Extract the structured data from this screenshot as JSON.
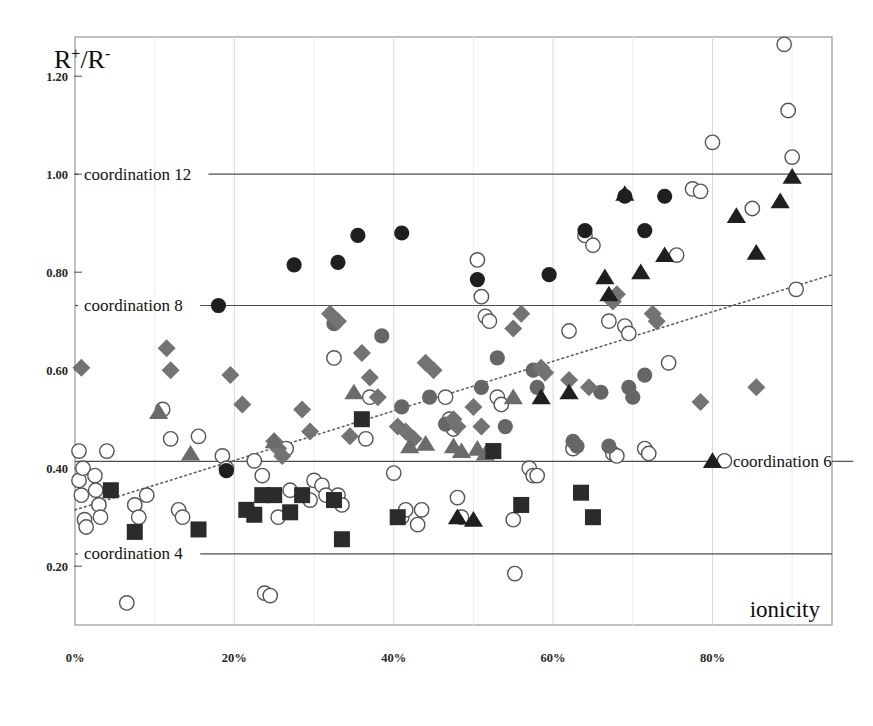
{
  "chart_data": {
    "type": "scatter",
    "title": "",
    "xlabel": "ionicity",
    "ylabel": "R+/R-",
    "ylabel_parts": {
      "base1": "R",
      "sup1": "+",
      "slash": "/",
      "base2": "R",
      "sup2": "-"
    },
    "xlim": [
      0,
      95
    ],
    "ylim": [
      0.08,
      1.28
    ],
    "xtick_labels": [
      "0%",
      "20%",
      "40%",
      "60%",
      "80%"
    ],
    "xtick_values": [
      0,
      20,
      40,
      60,
      80
    ],
    "ytick_labels": [
      "1.20",
      "1.00",
      "0.80",
      "0.60",
      "0.40",
      "0.20"
    ],
    "ytick_values": [
      1.2,
      1.0,
      0.8,
      0.6,
      0.4,
      0.2
    ],
    "grid": "light vertical gridlines at x ticks, horizontal reference lines at coordination values",
    "legend": "none",
    "reference_lines": [
      {
        "label": "coordination 12",
        "y": 1.0,
        "label_side": "left"
      },
      {
        "label": "coordination 8",
        "y": 0.732,
        "label_side": "left"
      },
      {
        "label": "coordination 6",
        "y": 0.414,
        "label_side": "right"
      },
      {
        "label": "coordination 4",
        "y": 0.225,
        "label_side": "left"
      }
    ],
    "trend_line": {
      "style": "dotted",
      "x0": 0,
      "y0": 0.315,
      "x1": 95,
      "y1": 0.795
    },
    "series": [
      {
        "name": "open-circle",
        "marker": "open_circle",
        "color": "#ffffff",
        "edge": "#555555",
        "points": [
          [
            0.5,
            0.435
          ],
          [
            0.5,
            0.375
          ],
          [
            0.8,
            0.345
          ],
          [
            1.0,
            0.4
          ],
          [
            1.2,
            0.295
          ],
          [
            1.4,
            0.28
          ],
          [
            2.5,
            0.385
          ],
          [
            2.6,
            0.355
          ],
          [
            3.0,
            0.325
          ],
          [
            3.2,
            0.3
          ],
          [
            4.0,
            0.435
          ],
          [
            6.5,
            0.125
          ],
          [
            7.5,
            0.325
          ],
          [
            8.0,
            0.3
          ],
          [
            9.0,
            0.345
          ],
          [
            11.0,
            0.52
          ],
          [
            12.0,
            0.46
          ],
          [
            13.0,
            0.315
          ],
          [
            13.5,
            0.3
          ],
          [
            15.5,
            0.465
          ],
          [
            18.5,
            0.425
          ],
          [
            19.0,
            0.4
          ],
          [
            22.5,
            0.415
          ],
          [
            23.5,
            0.385
          ],
          [
            23.8,
            0.145
          ],
          [
            24.5,
            0.14
          ],
          [
            25.5,
            0.3
          ],
          [
            26.5,
            0.44
          ],
          [
            27.0,
            0.355
          ],
          [
            29.5,
            0.335
          ],
          [
            30.0,
            0.375
          ],
          [
            31.0,
            0.365
          ],
          [
            31.5,
            0.345
          ],
          [
            32.5,
            0.625
          ],
          [
            33.0,
            0.345
          ],
          [
            33.5,
            0.325
          ],
          [
            36.5,
            0.46
          ],
          [
            37.0,
            0.545
          ],
          [
            40.0,
            0.39
          ],
          [
            41.0,
            0.3
          ],
          [
            41.5,
            0.315
          ],
          [
            43.0,
            0.285
          ],
          [
            43.5,
            0.315
          ],
          [
            46.5,
            0.545
          ],
          [
            47.0,
            0.5
          ],
          [
            47.5,
            0.48
          ],
          [
            48.0,
            0.34
          ],
          [
            48.5,
            0.3
          ],
          [
            50.5,
            0.825
          ],
          [
            51.0,
            0.75
          ],
          [
            51.5,
            0.71
          ],
          [
            52.0,
            0.7
          ],
          [
            53.0,
            0.545
          ],
          [
            53.5,
            0.53
          ],
          [
            55.0,
            0.295
          ],
          [
            55.2,
            0.185
          ],
          [
            57.0,
            0.4
          ],
          [
            57.5,
            0.385
          ],
          [
            58.0,
            0.385
          ],
          [
            62.0,
            0.68
          ],
          [
            62.5,
            0.44
          ],
          [
            64.0,
            0.875
          ],
          [
            65.0,
            0.855
          ],
          [
            67.0,
            0.7
          ],
          [
            67.5,
            0.43
          ],
          [
            68.0,
            0.425
          ],
          [
            69.0,
            0.69
          ],
          [
            69.5,
            0.675
          ],
          [
            71.5,
            0.44
          ],
          [
            72.0,
            0.43
          ],
          [
            74.5,
            0.615
          ],
          [
            75.5,
            0.835
          ],
          [
            77.5,
            0.97
          ],
          [
            78.5,
            0.965
          ],
          [
            80.0,
            1.065
          ],
          [
            81.5,
            0.415
          ],
          [
            85.0,
            0.93
          ],
          [
            89.0,
            1.265
          ],
          [
            89.5,
            1.13
          ],
          [
            90.0,
            1.035
          ],
          [
            90.5,
            0.765
          ]
        ]
      },
      {
        "name": "dark-filled-circle",
        "marker": "filled_circle",
        "color": "#1f1f1f",
        "points": [
          [
            18.0,
            0.732
          ],
          [
            19.0,
            0.395
          ],
          [
            27.5,
            0.815
          ],
          [
            33.0,
            0.82
          ],
          [
            35.5,
            0.875
          ],
          [
            41.0,
            0.88
          ],
          [
            50.5,
            0.785
          ],
          [
            59.5,
            0.795
          ],
          [
            64.0,
            0.885
          ],
          [
            69.0,
            0.955
          ],
          [
            71.5,
            0.885
          ],
          [
            74.0,
            0.955
          ]
        ]
      },
      {
        "name": "gray-circle",
        "marker": "gray_circle",
        "color": "#666666",
        "points": [
          [
            32.5,
            0.695
          ],
          [
            38.5,
            0.67
          ],
          [
            41.0,
            0.525
          ],
          [
            44.5,
            0.545
          ],
          [
            46.5,
            0.49
          ],
          [
            51.0,
            0.565
          ],
          [
            53.0,
            0.625
          ],
          [
            54.0,
            0.485
          ],
          [
            57.5,
            0.6
          ],
          [
            58.0,
            0.565
          ],
          [
            62.5,
            0.455
          ],
          [
            63.0,
            0.445
          ],
          [
            66.0,
            0.555
          ],
          [
            67.0,
            0.445
          ],
          [
            69.5,
            0.565
          ],
          [
            70.0,
            0.545
          ],
          [
            71.5,
            0.59
          ]
        ]
      },
      {
        "name": "gray-diamond",
        "marker": "diamond",
        "color": "#737373",
        "points": [
          [
            0.8,
            0.605
          ],
          [
            11.5,
            0.645
          ],
          [
            12.0,
            0.6
          ],
          [
            19.5,
            0.59
          ],
          [
            21.0,
            0.53
          ],
          [
            25.0,
            0.455
          ],
          [
            25.5,
            0.44
          ],
          [
            26.0,
            0.425
          ],
          [
            28.5,
            0.52
          ],
          [
            29.5,
            0.475
          ],
          [
            32.0,
            0.715
          ],
          [
            33.0,
            0.7
          ],
          [
            34.5,
            0.465
          ],
          [
            36.0,
            0.635
          ],
          [
            37.0,
            0.585
          ],
          [
            38.0,
            0.545
          ],
          [
            40.5,
            0.485
          ],
          [
            41.5,
            0.475
          ],
          [
            42.5,
            0.46
          ],
          [
            44.0,
            0.615
          ],
          [
            45.0,
            0.6
          ],
          [
            47.5,
            0.5
          ],
          [
            48.0,
            0.485
          ],
          [
            50.0,
            0.525
          ],
          [
            51.0,
            0.485
          ],
          [
            55.0,
            0.685
          ],
          [
            56.0,
            0.715
          ],
          [
            58.5,
            0.605
          ],
          [
            59.0,
            0.595
          ],
          [
            62.0,
            0.58
          ],
          [
            64.5,
            0.565
          ],
          [
            67.5,
            0.74
          ],
          [
            68.0,
            0.755
          ],
          [
            72.5,
            0.715
          ],
          [
            73.0,
            0.7
          ],
          [
            78.5,
            0.535
          ],
          [
            85.5,
            0.565
          ]
        ]
      },
      {
        "name": "gray-triangle",
        "marker": "triangle",
        "color": "#6b6b6b",
        "points": [
          [
            10.5,
            0.515
          ],
          [
            14.5,
            0.43
          ],
          [
            25.0,
            0.455
          ],
          [
            35.0,
            0.555
          ],
          [
            42.0,
            0.445
          ],
          [
            44.0,
            0.45
          ],
          [
            47.5,
            0.445
          ],
          [
            48.5,
            0.435
          ],
          [
            50.5,
            0.44
          ],
          [
            51.5,
            0.43
          ],
          [
            55.0,
            0.545
          ]
        ]
      },
      {
        "name": "dark-triangle",
        "marker": "dark_triangle",
        "color": "#1f1f1f",
        "points": [
          [
            48.0,
            0.3
          ],
          [
            50.0,
            0.295
          ],
          [
            58.5,
            0.545
          ],
          [
            62.0,
            0.555
          ],
          [
            66.5,
            0.79
          ],
          [
            67.0,
            0.755
          ],
          [
            69.0,
            0.96
          ],
          [
            71.0,
            0.8
          ],
          [
            74.0,
            0.835
          ],
          [
            80.0,
            0.415
          ],
          [
            83.0,
            0.915
          ],
          [
            85.5,
            0.84
          ],
          [
            88.5,
            0.945
          ],
          [
            90.0,
            0.995
          ]
        ]
      },
      {
        "name": "dark-square",
        "marker": "square",
        "color": "#2b2b2b",
        "points": [
          [
            4.5,
            0.355
          ],
          [
            7.5,
            0.27
          ],
          [
            15.5,
            0.275
          ],
          [
            21.5,
            0.315
          ],
          [
            22.5,
            0.305
          ],
          [
            23.5,
            0.345
          ],
          [
            25.0,
            0.345
          ],
          [
            27.0,
            0.31
          ],
          [
            28.5,
            0.345
          ],
          [
            32.5,
            0.335
          ],
          [
            33.5,
            0.255
          ],
          [
            36.0,
            0.5
          ],
          [
            40.5,
            0.3
          ],
          [
            52.5,
            0.435
          ],
          [
            56.0,
            0.325
          ],
          [
            63.5,
            0.35
          ],
          [
            65.0,
            0.3
          ]
        ]
      }
    ]
  },
  "axis_text": {
    "y_axis_label": "R+/R-",
    "x_axis_label": "ionicity"
  }
}
